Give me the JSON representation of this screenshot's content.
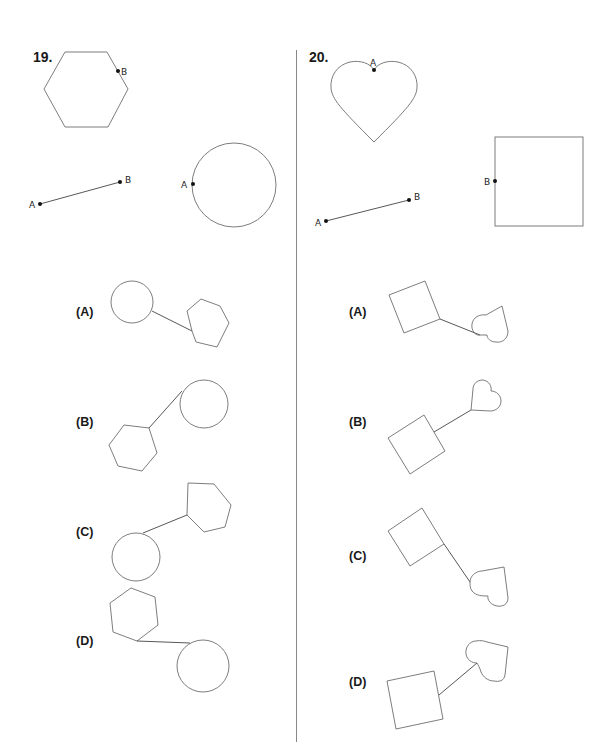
{
  "problems": [
    {
      "number": "19.",
      "given": {
        "shapes": [
          "hexagon",
          "segment",
          "circle"
        ],
        "hexagon_point": "B",
        "segment_points": [
          "A",
          "B"
        ],
        "circle_point": "A"
      },
      "options": [
        {
          "label": "(A)",
          "description": "circle connected by segment to hexagon at lower right"
        },
        {
          "label": "(B)",
          "description": "hexagon at lower left connected by segment to circle at upper right"
        },
        {
          "label": "(C)",
          "description": "circle at lower left connected by segment to hexagon at upper right"
        },
        {
          "label": "(D)",
          "description": "hexagon at upper left connected by segment to circle at lower right"
        }
      ]
    },
    {
      "number": "20.",
      "given": {
        "shapes": [
          "heart",
          "segment",
          "square"
        ],
        "heart_point": "A",
        "segment_points": [
          "A",
          "B"
        ],
        "square_point": "B"
      },
      "options": [
        {
          "label": "(A)",
          "description": "tilted square connected by segment to heart at lower right"
        },
        {
          "label": "(B)",
          "description": "tilted square at lower left connected by segment to heart at upper right"
        },
        {
          "label": "(C)",
          "description": "tilted square at upper left connected by segment to heart at lower right"
        },
        {
          "label": "(D)",
          "description": "tilted square at lower left connected by segment to heart at upper right"
        }
      ]
    }
  ],
  "point_labels": {
    "a": "A",
    "b": "B"
  }
}
